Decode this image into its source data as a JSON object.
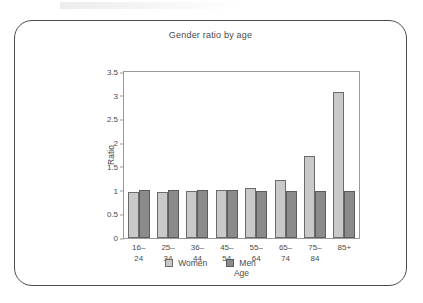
{
  "chart_data": {
    "type": "bar",
    "title": "Gender ratio by age",
    "xlabel": "Age",
    "ylabel": "Ratio",
    "categories": [
      "16–24",
      "25–34",
      "36–44",
      "45–54",
      "55–64",
      "65–74",
      "75–84",
      "85+"
    ],
    "category_lines": [
      [
        "16–",
        "24"
      ],
      [
        "25–",
        "34"
      ],
      [
        "36–",
        "44"
      ],
      [
        "45–",
        "54"
      ],
      [
        "55–",
        "64"
      ],
      [
        "65–",
        "74"
      ],
      [
        "75–",
        "84"
      ],
      [
        "85+",
        ""
      ]
    ],
    "series": [
      {
        "name": "Women",
        "color": "#c9c9c9",
        "values": [
          0.97,
          0.98,
          1.0,
          1.01,
          1.06,
          1.22,
          1.73,
          3.07
        ]
      },
      {
        "name": "Men",
        "color": "#8b8b8b",
        "values": [
          1.01,
          1.01,
          1.01,
          1.01,
          1.0,
          1.0,
          1.0,
          1.0
        ]
      }
    ],
    "ylim": [
      0,
      3.5
    ],
    "yticks": [
      "0",
      "0.5",
      "1",
      "1.5",
      "2",
      "2.5",
      "3",
      "3.5"
    ],
    "ytick_values": [
      0,
      0.5,
      1,
      1.5,
      2,
      2.5,
      3,
      3.5
    ],
    "grid": false,
    "legend_position": "bottom"
  }
}
